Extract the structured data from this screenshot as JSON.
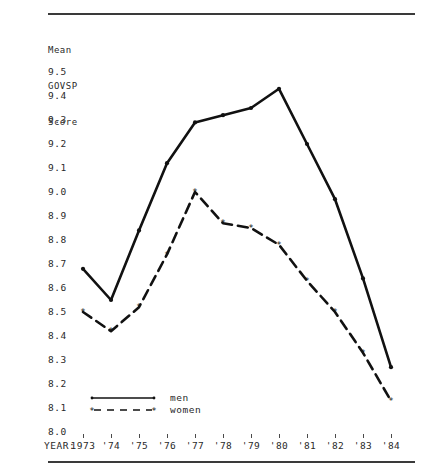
{
  "axis_title_lines": [
    "Mean",
    "GOVSP",
    "Score"
  ],
  "xaxis_caption": "YEAR:",
  "legend": {
    "men_label": "men",
    "women_label": "women"
  },
  "colors": {
    "line": "#111111",
    "text": "#2a2a2a",
    "rule": "#3a3a3a"
  },
  "chart_data": {
    "type": "line",
    "title": "Mean GOVSP Score",
    "xlabel": "YEAR:",
    "ylabel": "Mean GOVSP Score",
    "categories": [
      "1973",
      "'74",
      "'75",
      "'76",
      "'77",
      "'78",
      "'79",
      "'80",
      "'81",
      "'82",
      "'83",
      "'84"
    ],
    "x": [
      1973,
      1974,
      1975,
      1976,
      1977,
      1978,
      1979,
      1980,
      1981,
      1982,
      1983,
      1984
    ],
    "ylim": [
      8.0,
      9.5
    ],
    "ytick_labels": [
      "9.5",
      "9.4",
      "9.3",
      "9.2",
      "9.1",
      "9.0",
      "8.9",
      "8.8",
      "8.7",
      "8.6",
      "8.5",
      "8.4",
      "8.3",
      "8.2",
      "8.1",
      "8.0"
    ],
    "ytick_values": [
      9.5,
      9.4,
      9.3,
      9.2,
      9.1,
      9.0,
      8.9,
      8.8,
      8.7,
      8.6,
      8.5,
      8.4,
      8.3,
      8.2,
      8.1,
      8.0
    ],
    "grid": false,
    "legend_position": "inside-bottom-left",
    "series": [
      {
        "name": "men",
        "style": "solid",
        "marker": "dot",
        "values": [
          8.68,
          8.55,
          8.84,
          9.12,
          9.29,
          9.32,
          9.35,
          9.43,
          9.2,
          8.97,
          8.64,
          8.27
        ]
      },
      {
        "name": "women",
        "style": "dashed",
        "marker": "star",
        "values": [
          8.5,
          8.42,
          8.52,
          8.74,
          9.0,
          8.87,
          8.85,
          8.78,
          8.63,
          8.5,
          8.33,
          8.13
        ]
      }
    ]
  }
}
